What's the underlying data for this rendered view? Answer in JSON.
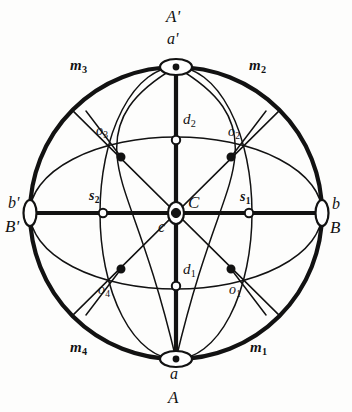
{
  "figure": {
    "type": "geometric-diagram",
    "background_color": "#fdfdfc",
    "ink_color": "#121212"
  },
  "geometry": {
    "center": {
      "x": 176,
      "y": 213
    },
    "radius": 146,
    "ellipse_wide_ry": 76,
    "ellipse_tall_rx": 76
  },
  "labels": {
    "pole_top_upper": "A'",
    "pole_top_lower": "a'",
    "pole_bottom_upper": "a",
    "pole_bottom_lower": "A",
    "pole_left_upper": "b'",
    "pole_left_lower": "B'",
    "pole_right_upper": "b",
    "pole_right_lower": "B",
    "center_upper": "C",
    "center_lower": "c",
    "m1": "m",
    "m1_sub": "1",
    "m2": "m",
    "m2_sub": "2",
    "m3": "m",
    "m3_sub": "3",
    "m4": "m",
    "m4_sub": "4",
    "o1": "o",
    "o1_sub": "1",
    "o2": "o",
    "o2_sub": "2",
    "o3": "o",
    "o3_sub": "3",
    "o4": "o",
    "o4_sub": "4",
    "s1": "s",
    "s1_sub": "1",
    "s2": "s",
    "s2_sub": "2",
    "d1": "d",
    "d1_sub": "1",
    "d2": "d",
    "d2_sub": "2"
  }
}
